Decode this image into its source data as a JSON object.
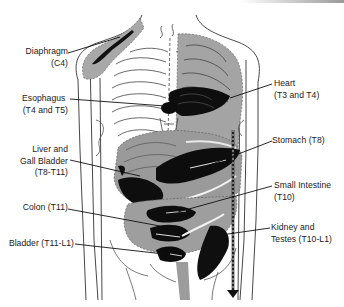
{
  "diagram": {
    "colors": {
      "background": "#ffffff",
      "line": "#222222",
      "referred_zone": "#9c9c9c",
      "intense_zone": "#111111",
      "label_text": "#1a1a1a"
    },
    "labels": {
      "diaphragm": {
        "name": "Diaphragm",
        "segment": "(C4)"
      },
      "esophagus": {
        "name": "Esophagus",
        "segment": "(T4 and T5)"
      },
      "liver": {
        "name_line1": "Liver and",
        "name_line2": "Gall Bladder",
        "segment": "(T8-T11)"
      },
      "colon": {
        "name": "Colon (T11)"
      },
      "bladder": {
        "name": "Bladder (T11-L1)"
      },
      "heart": {
        "name": "Heart",
        "segment": "(T3 and T4)"
      },
      "stomach": {
        "name": "Stomach (T8)"
      },
      "small_intestine": {
        "name": "Small Intestine",
        "segment": "(T10)"
      },
      "kidney": {
        "name": "Kidney and",
        "segment": "Testes (T10-L1)"
      }
    },
    "icons": {
      "down_arrow": "down-arrow-icon"
    }
  }
}
